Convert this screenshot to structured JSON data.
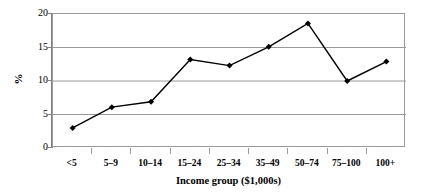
{
  "chart_data": {
    "type": "line",
    "title": "",
    "xlabel": "Income group ($1,000s)",
    "ylabel": "%",
    "categories": [
      "<5",
      "5–9",
      "10–14",
      "15–24",
      "25–34",
      "35–49",
      "50–74",
      "75–100",
      "100+"
    ],
    "values": [
      3.0,
      6.1,
      6.9,
      13.2,
      12.3,
      15.1,
      18.6,
      10.0,
      12.9
    ],
    "series": [
      {
        "name": "",
        "values": [
          3.0,
          6.1,
          6.9,
          13.2,
          12.3,
          15.1,
          18.6,
          10.0,
          12.9
        ]
      }
    ],
    "ylim": [
      0,
      20
    ],
    "y_ticks": [
      0,
      5,
      10,
      15,
      20
    ],
    "y_tick_labels": [
      "0",
      "5",
      "10",
      "15",
      "20"
    ],
    "grid": "horizontal",
    "legend": "none",
    "marker": "diamond",
    "line_color": "#000000",
    "marker_color": "#000000",
    "grid_color": "#9a9a9a",
    "axis_color": "#808080",
    "background": "#ffffff"
  },
  "axes": {
    "y_title": "%",
    "x_title": "Income group ($1,000s)"
  }
}
